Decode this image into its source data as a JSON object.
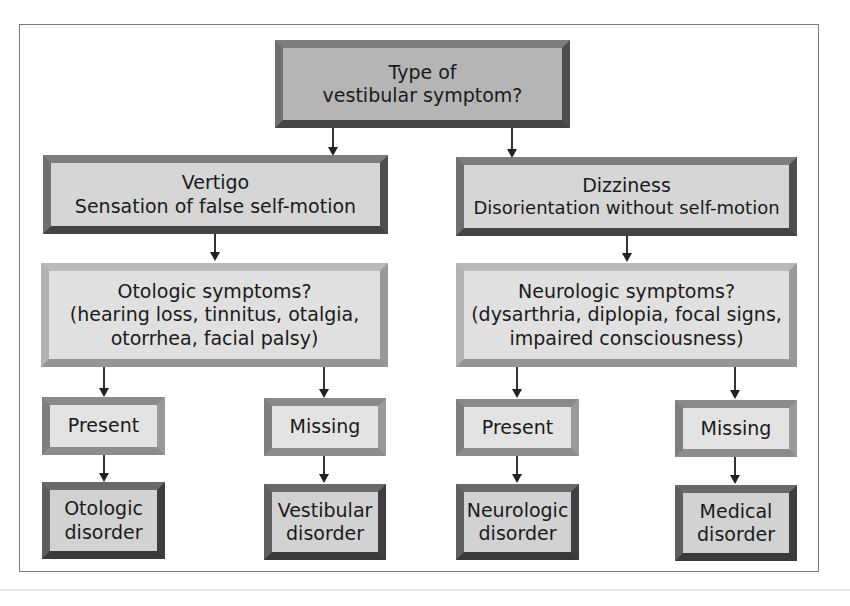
{
  "diagram": {
    "root": {
      "line1": "Type of",
      "line2": "vestibular symptom?"
    },
    "branches": [
      {
        "title": "Vertigo",
        "subtitle": "Sensation of false self-motion",
        "question": {
          "title": "Otologic symptoms?",
          "line1": "(hearing loss, tinnitus, otalgia,",
          "line2": "otorrhea, facial palsy)"
        },
        "answers": [
          {
            "label": "Present",
            "outcome_line1": "Otologic",
            "outcome_line2": "disorder"
          },
          {
            "label": "Missing",
            "outcome_line1": "Vestibular",
            "outcome_line2": "disorder"
          }
        ]
      },
      {
        "title": "Dizziness",
        "subtitle": "Disorientation without self-motion",
        "question": {
          "title": "Neurologic symptoms?",
          "line1": "(dysarthria, diplopia, focal signs,",
          "line2": "impaired consciousness)"
        },
        "answers": [
          {
            "label": "Present",
            "outcome_line1": "Neurologic",
            "outcome_line2": "disorder"
          },
          {
            "label": "Missing",
            "outcome_line1": "Medical",
            "outcome_line2": "disorder"
          }
        ]
      }
    ],
    "colors": {
      "box_fill": "#dcdcdc",
      "bevel_dark": "#444444",
      "bevel_light": "#b9b9b9",
      "arrow": "#222222",
      "frame": "#7a7a7a"
    }
  }
}
